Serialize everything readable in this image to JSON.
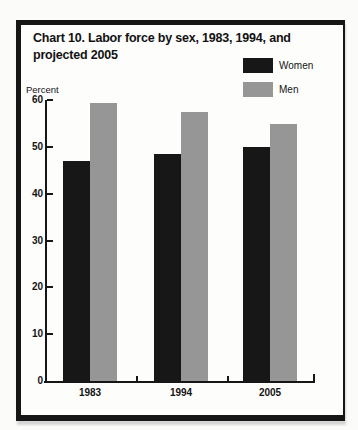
{
  "figure": {
    "title_lines": [
      "Chart 10. Labor force by sex, 1983, 1994, and",
      "projected 2005"
    ],
    "axis_unit_label": "Percent"
  },
  "legend": [
    {
      "label": "Women",
      "color": "#171717",
      "texture": false
    },
    {
      "label": "Men",
      "color": "#969696",
      "texture": true
    }
  ],
  "chart_data": {
    "type": "bar",
    "title": "Chart 10. Labor force by sex, 1983, 1994, and projected 2005",
    "xlabel": "",
    "ylabel": "Percent",
    "categories": [
      "1983",
      "1994",
      "2005"
    ],
    "series": [
      {
        "name": "Women",
        "color": "#171717",
        "texture": false,
        "values": [
          47,
          48.5,
          50
        ]
      },
      {
        "name": "Men",
        "color": "#969696",
        "texture": true,
        "values": [
          59.5,
          57.5,
          55
        ]
      }
    ],
    "ylim": [
      0,
      60
    ],
    "yticks": [
      0,
      10,
      20,
      30,
      40,
      50,
      60
    ],
    "grid": false,
    "legend_position": "top-right"
  }
}
